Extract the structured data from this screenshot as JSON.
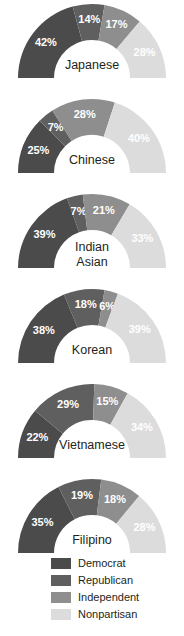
{
  "chart_data": {
    "type": "pie",
    "title": "",
    "subtitle": "",
    "variant": "half-donut",
    "arc_degrees": 180,
    "legend_position": "bottom",
    "value_unit": "%",
    "series_names": [
      "Democrat",
      "Republican",
      "Independent",
      "Nonpartisan"
    ],
    "series_colors": [
      "#4b4b4b",
      "#5f5f5f",
      "#8e8e8e",
      "#dcdcdc"
    ],
    "categories": [
      "Japanese",
      "Chinese",
      "Indian Asian",
      "Korean",
      "Vietnamese",
      "Filipino"
    ],
    "charts": [
      {
        "group": "Japanese",
        "group_lines": [
          "Japanese"
        ],
        "values": [
          42,
          14,
          17,
          28
        ],
        "labels": [
          "42%",
          "14%",
          "17%",
          "28%"
        ]
      },
      {
        "group": "Chinese",
        "group_lines": [
          "Chinese"
        ],
        "values": [
          25,
          7,
          28,
          40
        ],
        "labels": [
          "25%",
          "7%",
          "28%",
          "40%"
        ]
      },
      {
        "group": "Indian Asian",
        "group_lines": [
          "Indian",
          "Asian"
        ],
        "values": [
          39,
          7,
          21,
          33
        ],
        "labels": [
          "39%",
          "7%",
          "21%",
          "33%"
        ]
      },
      {
        "group": "Korean",
        "group_lines": [
          "Korean"
        ],
        "values": [
          38,
          18,
          6,
          39
        ],
        "labels": [
          "38%",
          "18%",
          "6%",
          "39%"
        ]
      },
      {
        "group": "Vietnamese",
        "group_lines": [
          "Vietnamese"
        ],
        "values": [
          22,
          29,
          15,
          34
        ],
        "labels": [
          "22%",
          "29%",
          "15%",
          "34%"
        ]
      },
      {
        "group": "Filipino",
        "group_lines": [
          "Filipino"
        ],
        "values": [
          35,
          19,
          18,
          28
        ],
        "labels": [
          "35%",
          "19%",
          "18%",
          "28%"
        ]
      }
    ]
  },
  "legend": {
    "items": [
      {
        "label": "Democrat",
        "color": "#4b4b4b"
      },
      {
        "label": "Republican",
        "color": "#5f5f5f"
      },
      {
        "label": "Independent",
        "color": "#8e8e8e"
      },
      {
        "label": "Nonpartisan",
        "color": "#dcdcdc"
      }
    ]
  }
}
